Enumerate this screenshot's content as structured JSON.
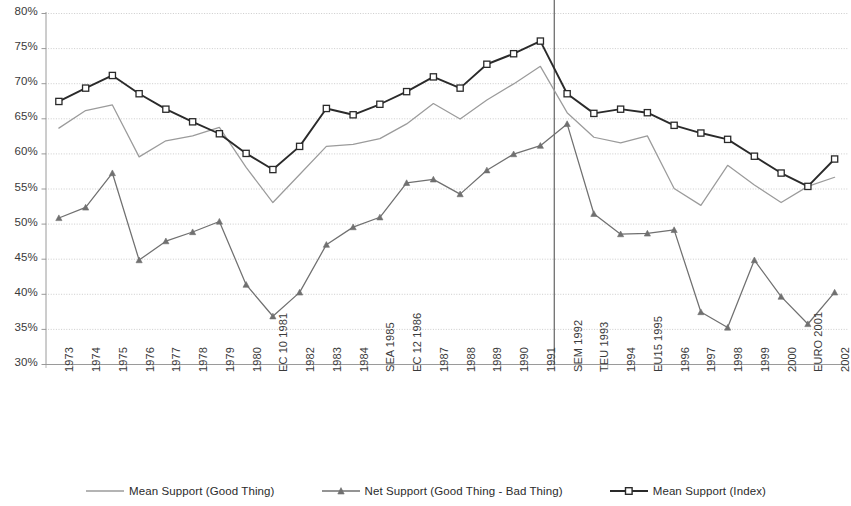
{
  "chart_data": {
    "type": "line",
    "title": "",
    "xlabel": "",
    "ylabel": "",
    "ylim": [
      30,
      80
    ],
    "ytick_step": 5,
    "grid": true,
    "legend_position": "bottom",
    "x": [
      "1973",
      "1974",
      "1975",
      "1976",
      "1977",
      "1978",
      "1979",
      "1980",
      "EC 10 1981",
      "1982",
      "1983",
      "1984",
      "SEA 1985",
      "EC 12 1986",
      "1987",
      "1988",
      "1989",
      "1990",
      "1991",
      "SEM 1992",
      "TEU 1993",
      "1994",
      "EU15 1995",
      "1996",
      "1997",
      "1998",
      "1999",
      "2000",
      "EURO 2001",
      "2002"
    ],
    "ytick_labels": [
      "80%",
      "75%",
      "70%",
      "65%",
      "60%",
      "55%",
      "50%",
      "45%",
      "40%",
      "35%",
      "30%"
    ],
    "ytick_values": [
      80,
      75,
      70,
      65,
      60,
      55,
      50,
      45,
      40,
      35,
      30
    ],
    "annotations": [
      {
        "name": "maastricht-divider",
        "type": "vline",
        "after_category": "1991",
        "x_index": 18.5
      }
    ],
    "series": [
      {
        "name": "Mean Support (Good Thing)",
        "color": "#9b9b9b",
        "marker": "none",
        "values": [
          63.6,
          66.1,
          66.9,
          59.5,
          61.8,
          62.5,
          63.7,
          58.0,
          53.0,
          57.0,
          61.0,
          61.3,
          62.1,
          64.2,
          67.1,
          64.9,
          67.6,
          69.9,
          72.4,
          65.8,
          62.3,
          61.5,
          62.5,
          55.0,
          52.6,
          58.3,
          55.5,
          53.0,
          55.3,
          56.6
        ]
      },
      {
        "name": "Net Support (Good Thing - Bad Thing)",
        "color": "#707070",
        "marker": "triangle",
        "values": [
          50.8,
          52.3,
          57.2,
          44.8,
          47.5,
          48.8,
          50.3,
          41.3,
          36.8,
          40.2,
          47.0,
          49.5,
          50.9,
          55.8,
          56.3,
          54.2,
          57.6,
          59.9,
          61.1,
          64.2,
          51.4,
          48.5,
          48.6,
          49.1,
          37.4,
          35.2,
          44.8,
          39.6,
          35.7,
          40.2
        ]
      },
      {
        "name": "Mean Support (Index)",
        "color": "#2a2a2a",
        "marker": "square-open",
        "values": [
          67.4,
          69.3,
          71.1,
          68.5,
          66.3,
          64.5,
          62.8,
          60.0,
          57.7,
          61.0,
          66.4,
          65.5,
          67.0,
          68.8,
          70.9,
          69.3,
          72.7,
          74.2,
          76.0,
          68.5,
          65.7,
          66.3,
          65.8,
          64.0,
          62.9,
          62.0,
          59.6,
          57.2,
          55.3,
          59.2
        ]
      }
    ]
  },
  "legend": {
    "items": [
      {
        "label": "Mean Support (Good Thing)",
        "color": "#9b9b9b",
        "marker": "none"
      },
      {
        "label": "Net Support (Good Thing - Bad Thing)",
        "color": "#707070",
        "marker": "triangle"
      },
      {
        "label": "Mean Support (Index)",
        "color": "#2a2a2a",
        "marker": "square-open"
      }
    ]
  },
  "axes": {
    "grid_color": "#bfbfbf",
    "axis_color": "#9a9a9a",
    "divider_color": "#555555"
  }
}
